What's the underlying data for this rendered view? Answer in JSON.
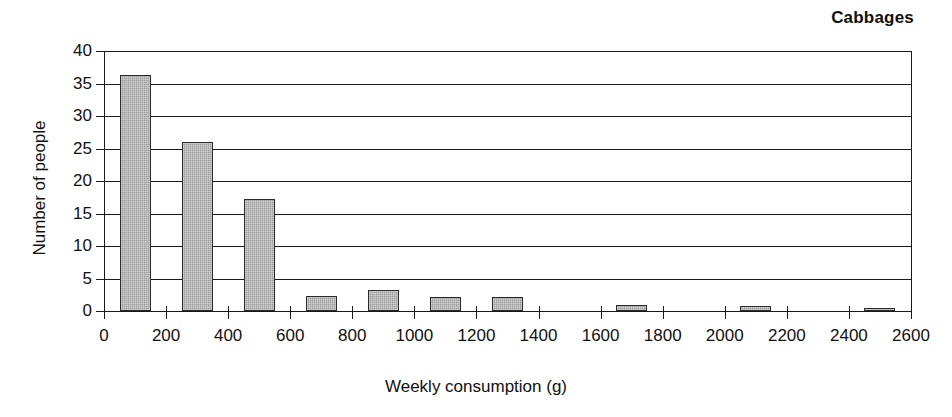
{
  "chart_data": {
    "type": "bar",
    "title": "Cabbages",
    "xlabel": "Weekly consumption (g)",
    "ylabel": "Number of people",
    "xlim": [
      0,
      2600
    ],
    "ylim": [
      0,
      40
    ],
    "xticks": [
      0,
      200,
      400,
      600,
      800,
      1000,
      1200,
      1400,
      1600,
      1800,
      2000,
      2200,
      2400,
      2600
    ],
    "yticks": [
      0,
      5,
      10,
      15,
      20,
      25,
      30,
      35,
      40
    ],
    "xtick_labels": [
      "0",
      "200",
      "400",
      "600",
      "800",
      "1000",
      "1200",
      "1400",
      "1600",
      "1800",
      "2000",
      "2200",
      "2400",
      "2600"
    ],
    "ytick_labels": [
      "0",
      "5",
      "10",
      "15",
      "20",
      "25",
      "30",
      "35",
      "40"
    ],
    "grid": "horizontal",
    "legend": "none",
    "bar_fill_color": "#9c9c9c",
    "bar_edge_color": "#2b2b2b",
    "bin_width": 100,
    "categories": [
      50,
      250,
      450,
      650,
      850,
      1050,
      1250,
      1450,
      1650,
      1850,
      2050,
      2250,
      2450
    ],
    "values": [
      36.3,
      26.0,
      17.2,
      2.3,
      3.2,
      2.2,
      2.1,
      0,
      1.0,
      0,
      0.75,
      0,
      0.5
    ],
    "bars": [
      {
        "bin_start": 50,
        "bin_end": 150,
        "value": 36.3
      },
      {
        "bin_start": 250,
        "bin_end": 350,
        "value": 26.0
      },
      {
        "bin_start": 450,
        "bin_end": 550,
        "value": 17.2
      },
      {
        "bin_start": 650,
        "bin_end": 750,
        "value": 2.3
      },
      {
        "bin_start": 850,
        "bin_end": 950,
        "value": 3.2
      },
      {
        "bin_start": 1050,
        "bin_end": 1150,
        "value": 2.2
      },
      {
        "bin_start": 1250,
        "bin_end": 1350,
        "value": 2.1
      },
      {
        "bin_start": 1650,
        "bin_end": 1750,
        "value": 1.0
      },
      {
        "bin_start": 2050,
        "bin_end": 2150,
        "value": 0.75
      },
      {
        "bin_start": 2450,
        "bin_end": 2550,
        "value": 0.5
      }
    ]
  }
}
